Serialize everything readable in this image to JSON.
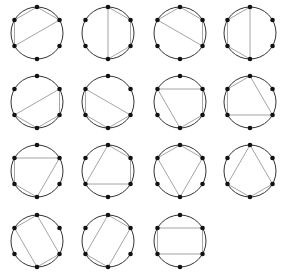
{
  "diagram": {
    "title": "",
    "points_per_circle": 6,
    "vertex_labels_note": "vertices indexed 0=top, 1=upper-right, 2=lower-right, 3=bottom, 4=lower-left, 5=upper-left",
    "colors": {
      "circle": "#333333",
      "chord": "#9a9a9a",
      "vertex": "#111111",
      "background": "#ffffff"
    },
    "layout": {
      "columns_x": [
        37,
        108,
        180,
        250
      ],
      "rows_y": [
        33,
        102,
        171,
        241
      ],
      "radius": 26,
      "vertex_radius": 2.3
    },
    "figures": [
      {
        "row": 0,
        "col": 0,
        "quad": [
          0,
          1,
          4,
          5
        ]
      },
      {
        "row": 0,
        "col": 1,
        "quad": [
          0,
          1,
          2,
          3
        ]
      },
      {
        "row": 0,
        "col": 2,
        "quad": [
          0,
          1,
          2,
          5
        ]
      },
      {
        "row": 0,
        "col": 3,
        "quad": [
          0,
          3,
          4,
          5
        ]
      },
      {
        "row": 1,
        "col": 0,
        "quad": [
          1,
          2,
          3,
          4
        ]
      },
      {
        "row": 1,
        "col": 1,
        "quad": [
          2,
          3,
          4,
          5
        ]
      },
      {
        "row": 1,
        "col": 2,
        "quad": [
          1,
          2,
          3,
          5
        ]
      },
      {
        "row": 1,
        "col": 3,
        "quad": [
          0,
          2,
          4,
          5
        ]
      },
      {
        "row": 2,
        "col": 0,
        "quad": [
          1,
          3,
          4,
          5
        ]
      },
      {
        "row": 2,
        "col": 1,
        "quad": [
          0,
          1,
          2,
          4
        ]
      },
      {
        "row": 2,
        "col": 2,
        "quad": [
          0,
          1,
          3,
          5
        ]
      },
      {
        "row": 2,
        "col": 3,
        "quad": [
          0,
          2,
          3,
          4
        ]
      },
      {
        "row": 3,
        "col": 0,
        "quad": [
          0,
          2,
          3,
          5
        ]
      },
      {
        "row": 3,
        "col": 1,
        "quad": [
          0,
          1,
          3,
          4
        ]
      },
      {
        "row": 3,
        "col": 2,
        "quad": [
          1,
          2,
          4,
          5
        ]
      }
    ]
  }
}
